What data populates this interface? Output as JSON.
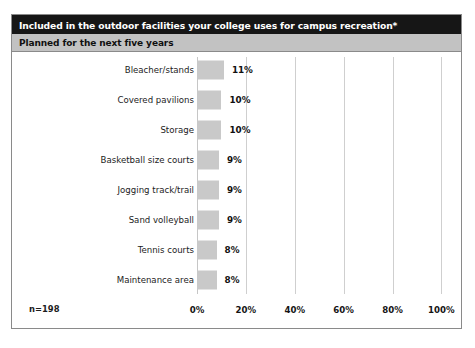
{
  "header": {
    "title": "Included in the outdoor facilities your college uses for campus recreation*",
    "subtitle": "Planned for the next five years"
  },
  "footnote": {
    "sample_size": "n=198"
  },
  "colors": {
    "title_bar": "#161616",
    "subtitle_bar": "#c2c2c2",
    "bar_fill": "#c9c9c9",
    "gridline": "#cfcfcf",
    "frame": "#8a8a8a",
    "text": "#101010"
  },
  "chart_data": {
    "type": "bar",
    "orientation": "horizontal",
    "title": "Included in the outdoor facilities your college uses for campus recreation*",
    "subtitle": "Planned for the next five years",
    "xlabel": "",
    "ylabel": "",
    "xlim": [
      0,
      100
    ],
    "grid": true,
    "legend": false,
    "annotation": "n=198",
    "xticks": [
      0,
      20,
      40,
      60,
      80,
      100
    ],
    "xtick_labels": [
      "0%",
      "20%",
      "40%",
      "60%",
      "80%",
      "100%"
    ],
    "categories": [
      "Bleacher/stands",
      "Covered pavilions",
      "Storage",
      "Basketball size courts",
      "Jogging track/trail",
      "Sand volleyball",
      "Tennis courts",
      "Maintenance area"
    ],
    "values": [
      11,
      10,
      10,
      9,
      9,
      9,
      8,
      8
    ],
    "value_labels": [
      "11%",
      "10%",
      "10%",
      "9%",
      "9%",
      "9%",
      "8%",
      "8%"
    ]
  }
}
